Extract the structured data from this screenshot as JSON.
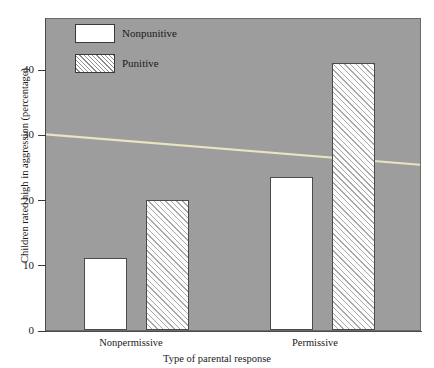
{
  "chart_data": {
    "type": "bar",
    "title": "",
    "xlabel": "Type of parental response",
    "ylabel": "Children rated high in aggression (percentage)",
    "categories": [
      "Nonpermissive",
      "Permissive"
    ],
    "series": [
      {
        "name": "Nonpunitive",
        "values": [
          11,
          23.5
        ],
        "style": "solid-white"
      },
      {
        "name": "Punitive",
        "values": [
          20,
          41
        ],
        "style": "hatched"
      }
    ],
    "ylim": [
      0,
      48
    ],
    "yticks": [
      0,
      10,
      20,
      30,
      40
    ],
    "ytick_labels": [
      "0",
      "10",
      "20",
      "30",
      "40"
    ],
    "grid": false,
    "legend_position": "top-left",
    "plot_background_color": "#9d9d9d",
    "annotations": [
      {
        "type": "trendline",
        "name": "pale-yellow-trend-line",
        "color": "#e8e5c0",
        "from": {
          "x_fraction": 0,
          "value": 30.2
        },
        "to": {
          "x_fraction": 1,
          "value": 25.5
        }
      }
    ]
  },
  "legend": {
    "items": [
      {
        "label": "Nonpunitive",
        "swatch": "solid-white-swatch"
      },
      {
        "label": "Punitive",
        "swatch": "hatched-swatch"
      }
    ]
  },
  "axes": {
    "y_title": "Children rated high in aggression (percentage)",
    "x_title": "Type of parental response",
    "y_ticks": [
      {
        "label": "40",
        "value": 40
      },
      {
        "label": "30",
        "value": 30
      },
      {
        "label": "20",
        "value": 20
      },
      {
        "label": "10",
        "value": 10
      },
      {
        "label": "0",
        "value": 0
      }
    ],
    "x_categories": [
      {
        "label": "Nonpermissive"
      },
      {
        "label": "Permissive"
      }
    ]
  },
  "bars": [
    {
      "name": "bar-nonpermissive-nonpunitive",
      "group": "Nonpermissive",
      "series": "Nonpunitive",
      "value": 11
    },
    {
      "name": "bar-nonpermissive-punitive",
      "group": "Nonpermissive",
      "series": "Punitive",
      "value": 20
    },
    {
      "name": "bar-permissive-nonpunitive",
      "group": "Permissive",
      "series": "Nonpunitive",
      "value": 23.5
    },
    {
      "name": "bar-permissive-punitive",
      "group": "Permissive",
      "series": "Punitive",
      "value": 41
    }
  ],
  "colors": {
    "plot_background": "#9d9d9d",
    "bar_solid": "#ffffff",
    "bar_outline": "#4a4a4a",
    "trendline": "#e8e5c0",
    "text": "#1a1a1a"
  }
}
